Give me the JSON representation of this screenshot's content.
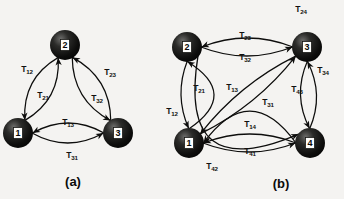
{
  "figure": {
    "background_color": "#f4f3f1",
    "ink_color": "#0d0d0c",
    "width": 344,
    "height": 199
  },
  "panels": [
    {
      "id": "panel-a",
      "caption": "(a)",
      "caption_pos": {
        "x": 73,
        "y": 181
      },
      "nodes": [
        {
          "id": "1",
          "label": "1",
          "x": 18,
          "y": 133,
          "r": 15
        },
        {
          "id": "2",
          "label": "2",
          "x": 65,
          "y": 45,
          "r": 15
        },
        {
          "id": "3",
          "label": "3",
          "x": 118,
          "y": 133,
          "r": 15
        }
      ],
      "edges": [
        {
          "id": "T12",
          "label": "T",
          "sub": "12",
          "from": "1",
          "to": "2",
          "bow": 11,
          "lx": 27,
          "ly": 70
        },
        {
          "id": "T21",
          "label": "T",
          "sub": "21",
          "from": "2",
          "to": "1",
          "bow": 11,
          "lx": 43,
          "ly": 96
        },
        {
          "id": "T23",
          "label": "T",
          "sub": "23",
          "from": "2",
          "to": "3",
          "bow": 11,
          "lx": 110,
          "ly": 73
        },
        {
          "id": "T32",
          "label": "T",
          "sub": "32",
          "from": "3",
          "to": "2",
          "bow": 11,
          "lx": 97,
          "ly": 99
        },
        {
          "id": "T13",
          "label": "T",
          "sub": "13",
          "from": "1",
          "to": "3",
          "bow": 10,
          "lx": 68,
          "ly": 123
        },
        {
          "id": "T31",
          "label": "T",
          "sub": "31",
          "from": "3",
          "to": "1",
          "bow": 10,
          "lx": 72,
          "ly": 156
        }
      ]
    },
    {
      "id": "panel-b",
      "caption": "(b)",
      "caption_pos": {
        "x": 281,
        "y": 183
      },
      "nodes": [
        {
          "id": "1",
          "label": "1",
          "x": 189,
          "y": 143,
          "r": 15
        },
        {
          "id": "2",
          "label": "2",
          "x": 187,
          "y": 47,
          "r": 15
        },
        {
          "id": "3",
          "label": "3",
          "x": 307,
          "y": 47,
          "r": 15
        },
        {
          "id": "4",
          "label": "4",
          "x": 310,
          "y": 143,
          "r": 15
        }
      ],
      "edges": [
        {
          "id": "T12",
          "label": "T",
          "sub": "12",
          "from": "1",
          "to": "2",
          "bow": 26,
          "lx": 172,
          "ly": 112
        },
        {
          "id": "T21",
          "label": "T",
          "sub": "21",
          "from": "2",
          "to": "1",
          "bow": 7,
          "lx": 199,
          "ly": 89
        },
        {
          "id": "T23",
          "label": "T",
          "sub": "23",
          "from": "2",
          "to": "3",
          "bow": 9,
          "lx": 245,
          "ly": 36
        },
        {
          "id": "T32",
          "label": "T",
          "sub": "32",
          "from": "3",
          "to": "2",
          "bow": 9,
          "lx": 245,
          "ly": 58
        },
        {
          "id": "T13",
          "label": "T",
          "sub": "13",
          "from": "1",
          "to": "3",
          "bow": 7,
          "lx": 232,
          "ly": 88
        },
        {
          "id": "T31",
          "label": "T",
          "sub": "31",
          "from": "3",
          "to": "1",
          "bow": 7,
          "lx": 268,
          "ly": 103
        },
        {
          "id": "T24",
          "label": "T",
          "sub": "24",
          "from": "2",
          "to": "4",
          "bow": 58,
          "lx": 301,
          "ly": 10
        },
        {
          "id": "T34",
          "label": "T",
          "sub": "34",
          "from": "3",
          "to": "4",
          "bow": 8,
          "lx": 323,
          "ly": 71
        },
        {
          "id": "T43",
          "label": "T",
          "sub": "43",
          "from": "4",
          "to": "3",
          "bow": 8,
          "lx": 297,
          "ly": 90
        },
        {
          "id": "T14",
          "label": "T",
          "sub": "14",
          "from": "1",
          "to": "4",
          "bow": 9,
          "lx": 250,
          "ly": 125
        },
        {
          "id": "T41",
          "label": "T",
          "sub": "41",
          "from": "4",
          "to": "1",
          "bow": 9,
          "lx": 250,
          "ly": 152
        },
        {
          "id": "T42",
          "label": "T",
          "sub": "42",
          "from": "4",
          "to": "1",
          "bow": 32,
          "lx": 212,
          "ly": 167
        }
      ]
    }
  ]
}
